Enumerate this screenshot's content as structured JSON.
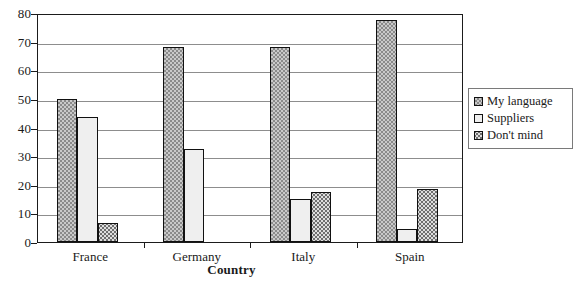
{
  "chart_data": {
    "type": "bar",
    "title": "",
    "subtitle": "",
    "xlabel": "Country",
    "ylabel": "",
    "categories": [
      "France",
      "Germany",
      "Italy",
      "Spain"
    ],
    "series": [
      {
        "name": "My language",
        "values": [
          50,
          68,
          68,
          77.5
        ],
        "pattern": "checker",
        "color": "#c9c9c9"
      },
      {
        "name": "Suppliers",
        "values": [
          43.5,
          32.5,
          15,
          4.5
        ],
        "pattern": "light-dots",
        "color": "#efefef"
      },
      {
        "name": "Don't mind",
        "values": [
          6.5,
          0,
          17.5,
          18.5
        ],
        "pattern": "dots",
        "color": "#dedede"
      }
    ],
    "ylim": [
      0,
      80
    ],
    "ytick_step": 10,
    "yticks": [
      "0",
      "10",
      "20",
      "30",
      "40",
      "50",
      "60",
      "70",
      "80"
    ],
    "grid": true,
    "grid_axis": "y",
    "legend_position": "right-outside",
    "bar_outline_color": "#111111",
    "grid_color": "#8d8d8d",
    "axis_color": "#1b1b1b"
  },
  "legend": {
    "items": [
      {
        "label": "My language"
      },
      {
        "label": "Suppliers"
      },
      {
        "label": "Don't mind"
      }
    ]
  }
}
